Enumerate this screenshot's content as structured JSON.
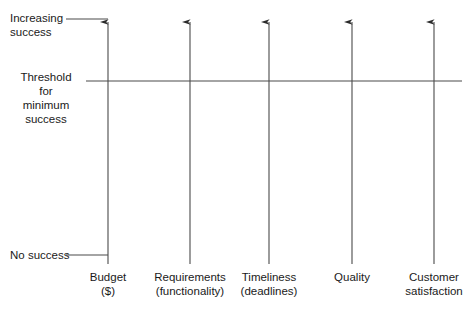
{
  "diagram": {
    "background_color": "#ffffff",
    "line_color": "#3a3a3a",
    "text_color": "#1a1a1a",
    "y_axis_labels": {
      "top": "Increasing\nsuccess",
      "middle": "Threshold\nfor\nminimum\nsuccess",
      "bottom": "No success"
    },
    "threshold_line": {
      "y": 81,
      "x_start": 86,
      "x_end": 462
    },
    "axes": [
      {
        "id": "budget",
        "label": "Budget\n($)",
        "x": 108
      },
      {
        "id": "requirements",
        "label": "Requirements\n(functionality)",
        "x": 190
      },
      {
        "id": "timeliness",
        "label": "Timeliness\n(deadlines)",
        "x": 269
      },
      {
        "id": "quality",
        "label": "Quality",
        "x": 352
      },
      {
        "id": "customer-satisfaction",
        "label": "Customer\nsatisfaction",
        "x": 434
      }
    ],
    "tick_marks": [
      {
        "id": "increasing-success-tick",
        "y": 19,
        "x_start": 66,
        "x_end": 108
      },
      {
        "id": "no-success-tick",
        "y": 255,
        "x_start": 66,
        "x_end": 108
      }
    ],
    "axis_geometry": {
      "top_y": 16,
      "bottom_y": 264
    }
  }
}
